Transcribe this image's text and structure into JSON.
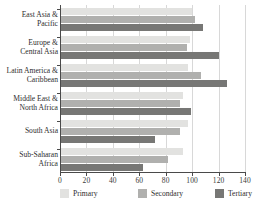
{
  "chart_data": {
    "type": "bar",
    "orientation": "horizontal",
    "title": "",
    "xlabel": "",
    "ylabel": "",
    "xlim": [
      0,
      140
    ],
    "xticks": [
      0,
      20,
      40,
      60,
      80,
      100,
      120,
      140
    ],
    "grid": true,
    "legend_position": "bottom",
    "categories": [
      "East Asia &\nPacific",
      "Europe &\nCentral Asia",
      "Latin America &\nCaribbean",
      "Middle East &\nNorth Africa",
      "South Asia",
      "Sub-Saharan\nAfrica"
    ],
    "series": [
      {
        "name": "Primary",
        "color": "#e2e2e0",
        "values": [
          100,
          98,
          97,
          93,
          97,
          93
        ]
      },
      {
        "name": "Secondary",
        "color": "#b0b0ae",
        "values": [
          102,
          96,
          107,
          91,
          91,
          82
        ]
      },
      {
        "name": "Tertiary",
        "color": "#777775",
        "values": [
          108,
          120,
          126,
          99,
          72,
          63
        ]
      }
    ]
  },
  "legend": {
    "items": [
      {
        "label": "Primary",
        "swatch": "primary"
      },
      {
        "label": "Secondary",
        "swatch": "secondary"
      },
      {
        "label": "Tertiary",
        "swatch": "tertiary"
      }
    ]
  },
  "axis": {
    "tick_labels": [
      "0",
      "20",
      "40",
      "60",
      "80",
      "100",
      "120",
      "140"
    ]
  }
}
